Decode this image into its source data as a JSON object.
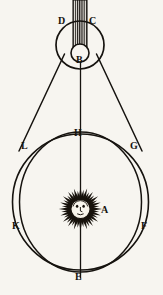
{
  "figure": {
    "kind": "astronomical-diagram",
    "caption": "",
    "background_color": "#f7f5f0",
    "ink_color": "#16130f"
  },
  "labels": [
    {
      "id": "D",
      "text": "D",
      "x": 60,
      "y": 17,
      "role": "point-label-left-of-upper-orb"
    },
    {
      "id": "C",
      "text": "C",
      "x": 90,
      "y": 17,
      "role": "point-label-right-of-upper-orb"
    },
    {
      "id": "B",
      "text": "B",
      "x": 76,
      "y": 56,
      "role": "point-label-inner-orb"
    },
    {
      "id": "H",
      "text": "H",
      "x": 76,
      "y": 131,
      "role": "point-label-top-of-great-circle"
    },
    {
      "id": "L",
      "text": "L",
      "x": 22,
      "y": 144,
      "role": "point-label-left-upper-crossing"
    },
    {
      "id": "G",
      "text": "G",
      "x": 130,
      "y": 144,
      "role": "point-label-right-upper-crossing"
    },
    {
      "id": "A",
      "text": "A",
      "x": 101,
      "y": 205,
      "role": "point-label-sun-center"
    },
    {
      "id": "K",
      "text": "K",
      "x": 14,
      "y": 222,
      "role": "point-label-left-lower-crossing"
    },
    {
      "id": "F",
      "text": "F",
      "x": 140,
      "y": 222,
      "role": "point-label-right-lower-crossing"
    },
    {
      "id": "E",
      "text": "E",
      "x": 76,
      "y": 272,
      "role": "point-label-bottom-of-great-circle"
    }
  ],
  "geometry": {
    "hatched_column": {
      "x": 73,
      "y": 0,
      "width": 14,
      "height": 46,
      "name": "hatched-band"
    },
    "upper_orb": {
      "cx": 80,
      "cy": 45,
      "r": 24,
      "name": "upper-orb-circle"
    },
    "inner_orb": {
      "cx": 80,
      "cy": 53,
      "r": 9,
      "name": "inner-orb-circle"
    },
    "great_circle": {
      "cx": 80.5,
      "cy": 202,
      "r": 68,
      "name": "great-circle"
    },
    "ellipse_orbit": {
      "cx": 80.5,
      "cy": 202,
      "rx": 61,
      "ry": 70,
      "name": "elliptical-orbit"
    },
    "axis_line": {
      "x": 80.5,
      "y1": 8,
      "y2": 277,
      "name": "vertical-axis"
    },
    "cone_left": {
      "x1": 63,
      "y1": 57,
      "x2": 23,
      "y2": 147,
      "name": "tangent-line-left"
    },
    "cone_right": {
      "x1": 98,
      "y1": 57,
      "x2": 138,
      "y2": 147,
      "name": "tangent-line-right"
    },
    "sun": {
      "cx": 80.5,
      "cy": 209,
      "r_core": 11,
      "r_rays": 21,
      "name": "sun-with-face"
    }
  }
}
